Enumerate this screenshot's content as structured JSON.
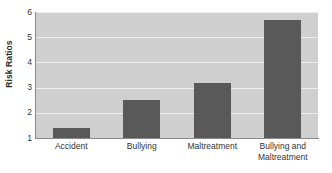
{
  "chart_data": {
    "type": "bar",
    "title": "",
    "xlabel": "",
    "ylabel": "Risk Ratios",
    "categories": [
      "Accident",
      "Bullying",
      "Maltreatment",
      "Bullying and Maltreatment"
    ],
    "values": [
      1.4,
      2.5,
      3.2,
      5.7
    ],
    "ylim": [
      1,
      6
    ],
    "yticks": [
      1,
      2,
      3,
      4,
      5,
      6
    ],
    "ytick_labels": [
      "1",
      "2",
      "3",
      "4",
      "5",
      "6"
    ],
    "grid": true,
    "legend": false,
    "colors": {
      "bar": "#595959",
      "plot_background": "#cfcfcf",
      "gridline": "#efefef",
      "axis": "#8a8a8a",
      "text": "#333333",
      "page_background": "#ffffff"
    }
  },
  "axis": {
    "y_title": "Risk Ratios"
  },
  "categories_wrapped": [
    [
      "Accident"
    ],
    [
      "Bullying"
    ],
    [
      "Maltreatment"
    ],
    [
      "Bullying and",
      "Maltreatment"
    ]
  ]
}
